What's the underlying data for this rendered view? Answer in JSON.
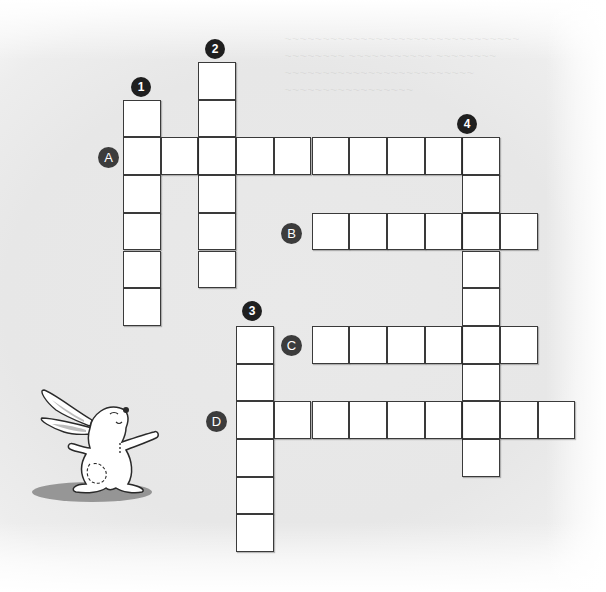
{
  "puzzle": {
    "type": "crossword",
    "grid": {
      "origin_x": 123,
      "origin_y": 62,
      "cell_size": 37.7,
      "cell_fill": "#ffffff",
      "cell_border": "#3a3a3a",
      "background": "#e8e8e8"
    },
    "down_words": [
      {
        "label": "1",
        "col": 0,
        "row": 1,
        "length": 6
      },
      {
        "label": "2",
        "col": 2,
        "row": 0,
        "length": 6
      },
      {
        "label": "3",
        "col": 3,
        "row": 7,
        "length": 6
      },
      {
        "label": "4",
        "col": 9,
        "row": 2,
        "length": 9
      }
    ],
    "across_words": [
      {
        "label": "A",
        "col": 0,
        "row": 2,
        "length": 10
      },
      {
        "label": "B",
        "col": 5,
        "row": 4,
        "length": 6
      },
      {
        "label": "C",
        "col": 5,
        "row": 7,
        "length": 6
      },
      {
        "label": "D",
        "col": 3,
        "row": 9,
        "length": 9
      }
    ],
    "number_badges": [
      {
        "label": "1",
        "x": 131,
        "y": 77
      },
      {
        "label": "2",
        "x": 205,
        "y": 39
      },
      {
        "label": "3",
        "x": 242,
        "y": 301
      },
      {
        "label": "4",
        "x": 457,
        "y": 114
      }
    ],
    "letter_badges": [
      {
        "label": "A",
        "x": 98,
        "y": 147
      },
      {
        "label": "B",
        "x": 281,
        "y": 223
      },
      {
        "label": "C",
        "x": 281,
        "y": 335
      },
      {
        "label": "D",
        "x": 206,
        "y": 411
      }
    ]
  },
  "illustration": {
    "name": "rabbit",
    "description": "cartoon white bunny with arms outstretched standing on a grey shadow"
  }
}
